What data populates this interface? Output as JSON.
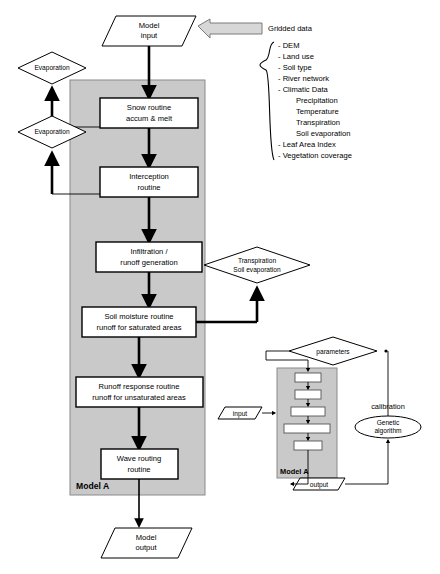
{
  "diagram": {
    "main_panel_label": "Model A",
    "sub_panel_label": "Model A"
  },
  "colors": {
    "panel_fill": "#c9c9c9",
    "box_fill": "#ffffff",
    "stroke": "#000000",
    "block_arrow_fill": "#d7d7d7"
  },
  "io": {
    "model_input_line1": "Model",
    "model_input_line2": "input",
    "model_output_line1": "Model",
    "model_output_line2": "output"
  },
  "gridded": {
    "heading": "Gridded data",
    "items": [
      "- DEM",
      "- Land use",
      "- Soil type",
      "- River network",
      "- Climatic Data"
    ],
    "climatic_sub": [
      "Precipitation",
      "Temperature",
      "Transpiration",
      "Soil evaporation"
    ],
    "items_tail": [
      "- Leaf Area Index",
      "- Vegetation coverage"
    ]
  },
  "process_boxes": [
    {
      "id": "snow",
      "line1": "Snow routine",
      "line2": "accum & melt"
    },
    {
      "id": "interception",
      "line1": "Interception",
      "line2": "routine"
    },
    {
      "id": "infiltration",
      "line1": "Infiltration /",
      "line2": "runoff generation"
    },
    {
      "id": "soil-moisture",
      "line1": "Soil moisture routine",
      "line2": "runoff for saturated areas"
    },
    {
      "id": "runoff",
      "line1": "Runoff response routine",
      "line2": "runoff for unsaturated areas"
    },
    {
      "id": "wave",
      "line1": "Wave routing",
      "line2": "routine"
    }
  ],
  "flux_shapes": [
    {
      "id": "evaporation-1",
      "label": "Evaporation"
    },
    {
      "id": "evaporation-2",
      "label": "Evaporation"
    }
  ],
  "transpiration": {
    "line1": "Transpiration",
    "line2": "Soil evaporation"
  },
  "calibration": {
    "input_label": "input",
    "output_label": "output",
    "parameters_label": "parameters",
    "calibration_label": "calibration",
    "ga_line1": "Genetic",
    "ga_line2": "algorithm"
  }
}
